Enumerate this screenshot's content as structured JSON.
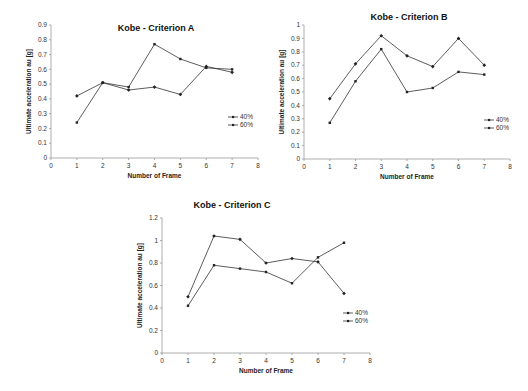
{
  "chart_data": [
    {
      "type": "line",
      "title": "Kobe - Criterion A",
      "xlabel": "Number of Frame",
      "ylabel": "Ultimate acceleration au [g]",
      "x": [
        1,
        2,
        3,
        4,
        5,
        6,
        7
      ],
      "xticks": [
        "0",
        "1",
        "2",
        "3",
        "4",
        "5",
        "6",
        "7",
        "8"
      ],
      "yticks": [
        "0",
        "0.1",
        "0.2",
        "0.3",
        "0.4",
        "0.5",
        "0.6",
        "0.7",
        "0.8",
        "0.9"
      ],
      "xlim": [
        0,
        8
      ],
      "ylim": [
        0,
        0.9
      ],
      "grid": false,
      "legend_position": "right",
      "series": [
        {
          "name": "40%",
          "values": [
            0.42,
            0.51,
            0.46,
            0.48,
            0.43,
            0.62,
            0.58
          ]
        },
        {
          "name": "60%",
          "values": [
            0.24,
            0.51,
            0.48,
            0.77,
            0.67,
            0.61,
            0.6
          ]
        }
      ]
    },
    {
      "type": "line",
      "title": "Kobe - Criterion B",
      "xlabel": "Number of Frame",
      "ylabel": "Ultimate acceleration au [g]",
      "x": [
        1,
        2,
        3,
        4,
        5,
        6,
        7
      ],
      "xticks": [
        "0",
        "1",
        "2",
        "3",
        "4",
        "5",
        "6",
        "7",
        "8"
      ],
      "yticks": [
        "0",
        "0.1",
        "0.2",
        "0.3",
        "0.4",
        "0.5",
        "0.6",
        "0.7",
        "0.8",
        "0.9",
        "1"
      ],
      "xlim": [
        0,
        8
      ],
      "ylim": [
        0,
        1
      ],
      "grid": false,
      "legend_position": "right",
      "series": [
        {
          "name": "40%",
          "values": [
            0.45,
            0.71,
            0.92,
            0.77,
            0.69,
            0.9,
            0.7
          ]
        },
        {
          "name": "60%",
          "values": [
            0.27,
            0.58,
            0.82,
            0.5,
            0.53,
            0.65,
            0.63
          ]
        }
      ]
    },
    {
      "type": "line",
      "title": "Kobe - Criterion C",
      "xlabel": "Number of Frame",
      "ylabel": "Ultimate acceleration au [g]",
      "x": [
        1,
        2,
        3,
        4,
        5,
        6,
        7
      ],
      "xticks": [
        "0",
        "1",
        "2",
        "3",
        "4",
        "5",
        "6",
        "7",
        "8"
      ],
      "yticks": [
        "0",
        "0.2",
        "0.4",
        "0.6",
        "0.8",
        "1",
        "1.2"
      ],
      "xlim": [
        0,
        8
      ],
      "ylim": [
        0,
        1.2
      ],
      "grid": false,
      "legend_position": "right",
      "series": [
        {
          "name": "40%",
          "values": [
            0.5,
            1.04,
            1.01,
            0.8,
            0.84,
            0.81,
            0.53
          ]
        },
        {
          "name": "60%",
          "values": [
            0.42,
            0.78,
            0.75,
            0.72,
            0.62,
            0.85,
            0.98
          ]
        }
      ]
    }
  ],
  "layout": [
    {
      "x0": 51,
      "x8": 258,
      "y0": 158,
      "ytop": 25,
      "title_x": 156,
      "title_y": 31,
      "leg_x": 228,
      "leg_y": 117
    },
    {
      "x0": 304,
      "x8": 510,
      "y0": 159,
      "ytop": 25,
      "title_x": 409,
      "title_y": 20,
      "leg_x": 484,
      "leg_y": 120
    },
    {
      "x0": 162,
      "x8": 370,
      "y0": 353,
      "ytop": 218,
      "title_x": 232,
      "title_y": 208,
      "leg_x": 343,
      "leg_y": 313
    }
  ],
  "colors": {
    "line": "#333333",
    "axis": "#999999",
    "text": "#222222"
  }
}
